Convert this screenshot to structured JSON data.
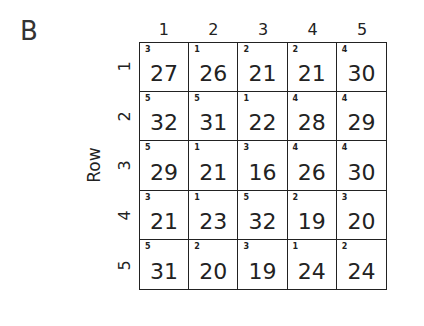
{
  "panel_label": "B",
  "axis_label": "Row",
  "column_headers": [
    "1",
    "2",
    "3",
    "4",
    "5"
  ],
  "row_headers": [
    "1",
    "2",
    "3",
    "4",
    "5"
  ],
  "cells": [
    [
      {
        "small": "3",
        "value": "27"
      },
      {
        "small": "1",
        "value": "26"
      },
      {
        "small": "2",
        "value": "21"
      },
      {
        "small": "2",
        "value": "21"
      },
      {
        "small": "4",
        "value": "30"
      }
    ],
    [
      {
        "small": "5",
        "value": "32"
      },
      {
        "small": "5",
        "value": "31"
      },
      {
        "small": "1",
        "value": "22"
      },
      {
        "small": "4",
        "value": "28"
      },
      {
        "small": "4",
        "value": "29"
      }
    ],
    [
      {
        "small": "5",
        "value": "29"
      },
      {
        "small": "1",
        "value": "21"
      },
      {
        "small": "3",
        "value": "16"
      },
      {
        "small": "4",
        "value": "26"
      },
      {
        "small": "4",
        "value": "30"
      }
    ],
    [
      {
        "small": "3",
        "value": "21"
      },
      {
        "small": "1",
        "value": "23"
      },
      {
        "small": "5",
        "value": "32"
      },
      {
        "small": "2",
        "value": "19"
      },
      {
        "small": "3",
        "value": "20"
      }
    ],
    [
      {
        "small": "5",
        "value": "31"
      },
      {
        "small": "2",
        "value": "20"
      },
      {
        "small": "3",
        "value": "19"
      },
      {
        "small": "1",
        "value": "24"
      },
      {
        "small": "2",
        "value": "24"
      }
    ]
  ]
}
